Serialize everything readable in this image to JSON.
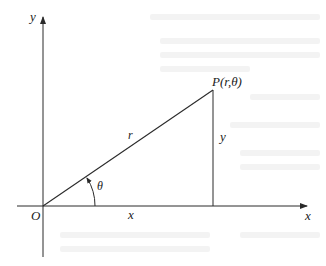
{
  "diagram": {
    "type": "polar-coordinate-triangle",
    "colors": {
      "stroke": "#2a2a2a",
      "text": "#222222",
      "background": "#ffffff"
    },
    "labels": {
      "y_axis": "y",
      "x_axis": "x",
      "origin": "O",
      "point": "P(r,θ)",
      "hypotenuse": "r",
      "vertical_leg": "y",
      "horizontal_leg": "x",
      "angle": "θ"
    }
  }
}
